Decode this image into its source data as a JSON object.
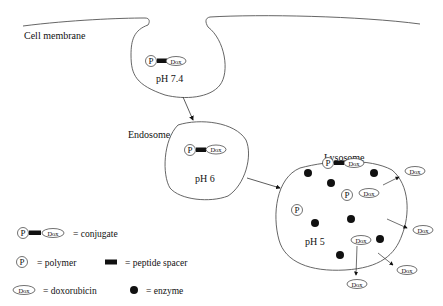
{
  "labels": {
    "cell_membrane": "Cell membrane",
    "endosome": "Endosome",
    "lysosome": "Lysosome"
  },
  "compartments": {
    "vesicle_ph": "pH 7.4",
    "endosome_ph": "pH 6",
    "lysosome_ph": "pH 5"
  },
  "symbols": {
    "polymer": "P",
    "drug": "Dox"
  },
  "legend": {
    "conjugate": "= conjugate",
    "polymer": "= polymer",
    "peptide_spacer": "= peptide spacer",
    "doxorubicin": "= doxorubicin",
    "enzyme": "= enzyme"
  },
  "colors": {
    "ink": "#111111",
    "membrane": "#555555"
  }
}
